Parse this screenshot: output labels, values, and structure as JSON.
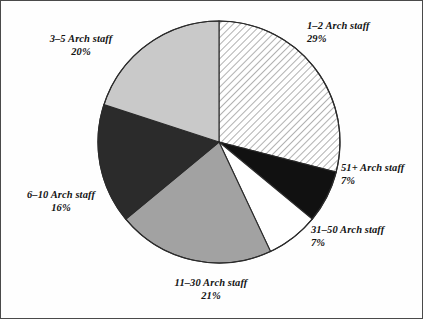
{
  "figure": {
    "title": "",
    "border_color": "#4a4a4a",
    "background": "#fefefe"
  },
  "chart_data": {
    "type": "pie",
    "title": "",
    "xlabel": "",
    "ylabel": "",
    "legend_position": "none",
    "grid": false,
    "start_angle_deg": 0,
    "direction": "clockwise",
    "center": {
      "x": 218,
      "y": 141,
      "r": 121
    },
    "categories": [
      "1-2 Arch staff",
      "51+ Arch staff",
      "31-50 Arch staff",
      "11-30 Arch staff",
      "6-10 Arch staff",
      "3-5 Arch staff"
    ],
    "values": [
      29,
      7,
      7,
      21,
      16,
      20
    ],
    "value_labels": [
      "29%",
      "7%",
      "7%",
      "21%",
      "16%",
      "20%"
    ],
    "slices": [
      {
        "name": "1-2 Arch staff",
        "label": "1–2 Arch staff",
        "percent": 29,
        "percent_label": "29%",
        "fill_style": "diagonal-hatch",
        "fill_color": "#ffffff",
        "hatch_color": "#8f8f8f",
        "start_deg": 0,
        "end_deg": 104.4
      },
      {
        "name": "51+ Arch staff",
        "label": "51+ Arch staff",
        "percent": 7,
        "percent_label": "7%",
        "fill_style": "solid",
        "fill_color": "#111111",
        "hatch_color": "",
        "start_deg": 104.4,
        "end_deg": 129.6
      },
      {
        "name": "31-50 Arch staff",
        "label": "31–50 Arch staff",
        "percent": 7,
        "percent_label": "7%",
        "fill_style": "solid",
        "fill_color": "#ffffff",
        "hatch_color": "",
        "start_deg": 129.6,
        "end_deg": 154.8
      },
      {
        "name": "11-30 Arch staff",
        "label": "11–30 Arch staff",
        "percent": 21,
        "percent_label": "21%",
        "fill_style": "solid",
        "fill_color": "#a2a2a2",
        "hatch_color": "",
        "start_deg": 154.8,
        "end_deg": 230.4
      },
      {
        "name": "6-10 Arch staff",
        "label": "6–10 Arch staff",
        "percent": 16,
        "percent_label": "16%",
        "fill_style": "solid",
        "fill_color": "#2b2b2b",
        "hatch_color": "",
        "start_deg": 230.4,
        "end_deg": 288.0
      },
      {
        "name": "3-5 Arch staff",
        "label": "3–5 Arch staff",
        "percent": 20,
        "percent_label": "20%",
        "fill_style": "solid",
        "fill_color": "#c9c9c9",
        "hatch_color": "",
        "start_deg": 288.0,
        "end_deg": 360.0
      }
    ],
    "labels": [
      {
        "text": "1–2 Arch staff",
        "percent_label": "29%"
      },
      {
        "text": "3–5 Arch staff",
        "percent_label": "20%"
      },
      {
        "text": "6–10 Arch staff",
        "percent_label": "16%"
      },
      {
        "text": "11–30 Arch staff",
        "percent_label": "21%"
      },
      {
        "text": "31–50 Arch staff",
        "percent_label": "7%"
      },
      {
        "text": "51+ Arch staff",
        "percent_label": "7%"
      }
    ]
  }
}
